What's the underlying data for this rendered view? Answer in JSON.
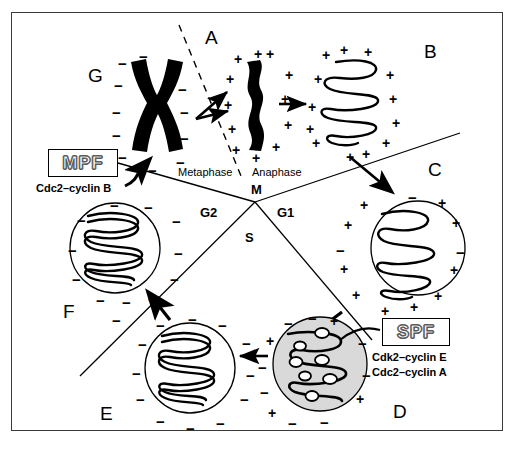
{
  "figure": {
    "background": "#ffffff",
    "frame_color": "#3a3a3a",
    "nucleus_shaded_fill": "#d9d9d9",
    "stroke_color": "#000000"
  },
  "stage_letters": [
    {
      "id": "A",
      "label": "A",
      "x": 205,
      "y": 28
    },
    {
      "id": "B",
      "label": "B",
      "x": 424,
      "y": 42
    },
    {
      "id": "C",
      "label": "C",
      "x": 428,
      "y": 160
    },
    {
      "id": "D",
      "label": "D",
      "x": 393,
      "y": 402
    },
    {
      "id": "E",
      "label": "E",
      "x": 100,
      "y": 404
    },
    {
      "id": "F",
      "label": "F",
      "x": 63,
      "y": 302
    },
    {
      "id": "G",
      "label": "G",
      "x": 88,
      "y": 66
    }
  ],
  "phase_labels": [
    {
      "id": "metaphase",
      "label": "Metaphase",
      "style": "plain",
      "x": 178,
      "y": 167
    },
    {
      "id": "anaphase",
      "label": "Anaphase",
      "style": "plain",
      "x": 252,
      "y": 167
    },
    {
      "id": "m-phase",
      "label": "M",
      "style": "bold",
      "x": 251,
      "y": 183
    },
    {
      "id": "g2-phase",
      "label": "G2",
      "style": "bold",
      "x": 200,
      "y": 206
    },
    {
      "id": "g1-phase",
      "label": "G1",
      "style": "bold",
      "x": 277,
      "y": 206
    },
    {
      "id": "s-phase",
      "label": "S",
      "style": "bold",
      "x": 245,
      "y": 231
    }
  ],
  "factors": [
    {
      "id": "mpf",
      "name": "MPF",
      "subtitle": "Cdc2–cyclin B",
      "box": {
        "x": 48,
        "y": 149,
        "w": 70,
        "h": 28
      },
      "subtitle_pos": {
        "x": 36,
        "y": 182
      }
    },
    {
      "id": "spf",
      "name": "SPF",
      "subtitle_line1": "Cdk2–cyclin E",
      "subtitle_line2": "Cdc2–cyclin A",
      "box": {
        "x": 382,
        "y": 318,
        "w": 68,
        "h": 28
      },
      "subtitle_pos": {
        "x": 372,
        "y": 351
      }
    }
  ],
  "hub": {
    "x": 255,
    "y": 202
  },
  "divider_lines": [
    {
      "id": "divider-metaphase-g2",
      "x1": 118,
      "y1": 163,
      "x2": 255,
      "y2": 202
    },
    {
      "id": "divider-anaphase-g1",
      "x1": 255,
      "y1": 202,
      "x2": 460,
      "y2": 133
    },
    {
      "id": "divider-g2-s",
      "x1": 255,
      "y1": 202,
      "x2": 80,
      "y2": 376
    },
    {
      "id": "divider-g1-s",
      "x1": 255,
      "y1": 202,
      "x2": 372,
      "y2": 340
    }
  ],
  "dashed_spindle": {
    "id": "metaphase-plate-dashed",
    "x1": 179,
    "y1": 25,
    "x2": 241,
    "y2": 176
  },
  "arrows": [
    {
      "id": "arrow-g-to-a-upper",
      "desc": "condensed chromosome to anaphase, upper branch"
    },
    {
      "id": "arrow-g-to-a-lower",
      "desc": "condensed chromosome to anaphase, lower branch"
    },
    {
      "id": "arrow-a-to-b",
      "desc": "anaphase chromosome to decondensing chromatin"
    },
    {
      "id": "arrow-b-to-c",
      "desc": "decondensing chromatin into G1 nucleus"
    },
    {
      "id": "arrow-c-to-d",
      "desc": "G1 nucleus into S phase nucleus"
    },
    {
      "id": "arrow-d-to-e",
      "desc": "S phase nucleus into G2 nucleus"
    },
    {
      "id": "arrow-e-to-f",
      "desc": "G2 nucleus to condensing nucleus"
    },
    {
      "id": "arrow-mpf-to-chromosome",
      "desc": "MPF acts on condensed chromosome"
    },
    {
      "id": "arrow-spf-to-s-nucleus",
      "desc": "SPF acts on S phase nucleus"
    }
  ],
  "nuclei": [
    {
      "id": "nucleus-c-g1",
      "stage": "C",
      "cx": 418,
      "cy": 248,
      "r": 47,
      "fill": "none",
      "charge": "+",
      "chromatin": "condensed-single"
    },
    {
      "id": "nucleus-d-s",
      "stage": "D",
      "cx": 320,
      "cy": 364,
      "r": 47,
      "fill": "#d9d9d9",
      "charge": "-",
      "chromatin": "replication-bubbles"
    },
    {
      "id": "nucleus-e-g2",
      "stage": "E",
      "cx": 190,
      "cy": 368,
      "r": 45,
      "fill": "none",
      "charge": "-",
      "chromatin": "decondensed-double"
    },
    {
      "id": "nucleus-f",
      "stage": "F",
      "cx": 115,
      "cy": 248,
      "r": 45,
      "fill": "none",
      "charge": "-",
      "chromatin": "decondensed-double"
    }
  ],
  "chromosomes": [
    {
      "id": "chromosome-g-metaphase",
      "stage": "G",
      "shape": "X",
      "cx": 148,
      "cy": 105,
      "charge": "-"
    },
    {
      "id": "chromosome-a-anaphase",
      "stage": "A",
      "shape": "rod",
      "cx": 252,
      "cy": 100,
      "charge": "+"
    },
    {
      "id": "chromatin-b-decondensing",
      "stage": "B",
      "shape": "coil",
      "cx": 355,
      "cy": 100,
      "charge": "+"
    }
  ],
  "charges": {
    "plus_symbol": "+",
    "minus_symbol": "−",
    "g_cluster": [
      {
        "s": "-",
        "x": 118,
        "y": 56
      },
      {
        "s": "-",
        "x": 139,
        "y": 49
      },
      {
        "s": "-",
        "x": 173,
        "y": 57
      },
      {
        "s": "-",
        "x": 114,
        "y": 78
      },
      {
        "s": "-",
        "x": 178,
        "y": 82
      },
      {
        "s": "-",
        "x": 112,
        "y": 105
      },
      {
        "s": "-",
        "x": 180,
        "y": 105
      },
      {
        "s": "-",
        "x": 112,
        "y": 128
      },
      {
        "s": "-",
        "x": 180,
        "y": 131
      },
      {
        "s": "-",
        "x": 118,
        "y": 150
      },
      {
        "s": "-",
        "x": 176,
        "y": 155
      },
      {
        "s": "-",
        "x": 148,
        "y": 163
      }
    ],
    "a_cluster": [
      {
        "s": "+",
        "x": 234,
        "y": 52
      },
      {
        "s": "+",
        "x": 254,
        "y": 47
      },
      {
        "s": "+",
        "x": 266,
        "y": 47
      },
      {
        "s": "+",
        "x": 226,
        "y": 72
      },
      {
        "s": "+",
        "x": 285,
        "y": 68
      },
      {
        "s": "+",
        "x": 224,
        "y": 98
      },
      {
        "s": "+",
        "x": 281,
        "y": 92
      },
      {
        "s": "+",
        "x": 228,
        "y": 122
      },
      {
        "s": "+",
        "x": 284,
        "y": 118
      },
      {
        "s": "+",
        "x": 232,
        "y": 143
      },
      {
        "s": "+",
        "x": 272,
        "y": 140
      },
      {
        "s": "+",
        "x": 252,
        "y": 151
      }
    ],
    "b_cluster": [
      {
        "s": "+",
        "x": 322,
        "y": 48
      },
      {
        "s": "+",
        "x": 340,
        "y": 43
      },
      {
        "s": "+",
        "x": 364,
        "y": 45
      },
      {
        "s": "+",
        "x": 314,
        "y": 72
      },
      {
        "s": "+",
        "x": 386,
        "y": 68
      },
      {
        "s": "+",
        "x": 308,
        "y": 100
      },
      {
        "s": "+",
        "x": 389,
        "y": 92
      },
      {
        "s": "+",
        "x": 306,
        "y": 122
      },
      {
        "s": "+",
        "x": 392,
        "y": 116
      },
      {
        "s": "+",
        "x": 312,
        "y": 136
      },
      {
        "s": "+",
        "x": 382,
        "y": 136
      },
      {
        "s": "+",
        "x": 362,
        "y": 147
      },
      {
        "s": "+",
        "x": 346,
        "y": 150
      }
    ],
    "c_cluster": [
      {
        "s": "-",
        "x": 408,
        "y": 190
      },
      {
        "s": "+",
        "x": 360,
        "y": 198
      },
      {
        "s": "+",
        "x": 438,
        "y": 196
      },
      {
        "s": "+",
        "x": 344,
        "y": 218
      },
      {
        "s": "+",
        "x": 452,
        "y": 216
      },
      {
        "s": "-",
        "x": 336,
        "y": 243
      },
      {
        "s": "-",
        "x": 456,
        "y": 245
      },
      {
        "s": "+",
        "x": 340,
        "y": 262
      },
      {
        "s": "+",
        "x": 450,
        "y": 263
      },
      {
        "s": "+",
        "x": 352,
        "y": 288
      },
      {
        "s": "+",
        "x": 434,
        "y": 289
      },
      {
        "s": "+",
        "x": 381,
        "y": 304
      },
      {
        "s": "+",
        "x": 410,
        "y": 300
      }
    ],
    "d_cluster": [
      {
        "s": "-",
        "x": 284,
        "y": 316
      },
      {
        "s": "-",
        "x": 308,
        "y": 311
      },
      {
        "s": "+",
        "x": 330,
        "y": 314
      },
      {
        "s": "+",
        "x": 266,
        "y": 334
      },
      {
        "s": "-",
        "x": 358,
        "y": 336
      },
      {
        "s": "-",
        "x": 258,
        "y": 360
      },
      {
        "s": "-",
        "x": 362,
        "y": 368
      },
      {
        "s": "-",
        "x": 260,
        "y": 385
      },
      {
        "s": "+",
        "x": 356,
        "y": 392
      },
      {
        "s": "+",
        "x": 268,
        "y": 406
      },
      {
        "s": "-",
        "x": 288,
        "y": 416
      },
      {
        "s": "-",
        "x": 320,
        "y": 415
      }
    ],
    "e_cluster": [
      {
        "s": "-",
        "x": 156,
        "y": 318
      },
      {
        "s": "-",
        "x": 188,
        "y": 312
      },
      {
        "s": "-",
        "x": 218,
        "y": 318
      },
      {
        "s": "-",
        "x": 138,
        "y": 337
      },
      {
        "s": "-",
        "x": 242,
        "y": 336
      },
      {
        "s": "-",
        "x": 132,
        "y": 366
      },
      {
        "s": "-",
        "x": 246,
        "y": 368
      },
      {
        "s": "-",
        "x": 136,
        "y": 392
      },
      {
        "s": "-",
        "x": 240,
        "y": 392
      },
      {
        "s": "-",
        "x": 156,
        "y": 414
      },
      {
        "s": "-",
        "x": 186,
        "y": 421
      },
      {
        "s": "-",
        "x": 216,
        "y": 416
      }
    ],
    "f_cluster": [
      {
        "s": "-",
        "x": 110,
        "y": 198
      },
      {
        "s": "-",
        "x": 144,
        "y": 200
      },
      {
        "s": "-",
        "x": 77,
        "y": 213
      },
      {
        "s": "-",
        "x": 172,
        "y": 214
      },
      {
        "s": "-",
        "x": 68,
        "y": 243
      },
      {
        "s": "-",
        "x": 174,
        "y": 246
      },
      {
        "s": "-",
        "x": 72,
        "y": 272
      },
      {
        "s": "-",
        "x": 170,
        "y": 272
      },
      {
        "s": "-",
        "x": 96,
        "y": 293
      },
      {
        "s": "-",
        "x": 122,
        "y": 295
      },
      {
        "s": "-",
        "x": 148,
        "y": 292
      },
      {
        "s": "-",
        "x": 112,
        "y": 313
      }
    ]
  }
}
